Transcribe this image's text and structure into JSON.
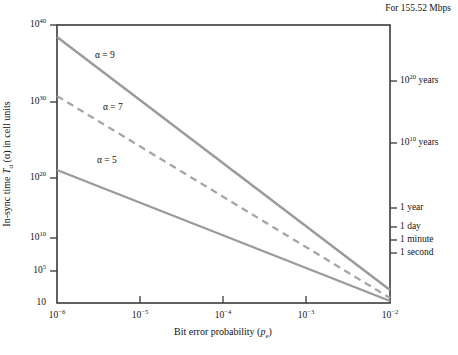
{
  "chart_data": {
    "type": "line",
    "title": "",
    "note": "For 155.52 Mbps",
    "xlabel_html": "Bit error probability (<i>p</i><sub>e</sub>)",
    "xlabel": "Bit error probability (pe)",
    "ylabel_html": "In-sync time <i>T</i><sub>d</sub> (α) in cell units",
    "ylabel": "In-sync time Td (α) in cell units",
    "xscale": "log",
    "yscale": "log",
    "xlim": [
      1e-06,
      0.01
    ],
    "ylim": [
      10,
      1e+40
    ],
    "grid": false,
    "legend_position": "inline-annotations",
    "xticks": [
      {
        "value": 1e-06,
        "mantissa": "10",
        "exponent": "−6"
      },
      {
        "value": 1e-05,
        "mantissa": "10",
        "exponent": "−5"
      },
      {
        "value": 0.0001,
        "mantissa": "10",
        "exponent": "−4"
      },
      {
        "value": 0.001,
        "mantissa": "10",
        "exponent": "−3"
      },
      {
        "value": 0.01,
        "mantissa": "10",
        "exponent": "−2"
      }
    ],
    "yticks_left": [
      {
        "value": 1e+40,
        "mantissa": "10",
        "exponent": "40"
      },
      {
        "value": 1e+30,
        "mantissa": "10",
        "exponent": "30"
      },
      {
        "value": 1e+20,
        "mantissa": "10",
        "exponent": "20"
      },
      {
        "value": 10000000000.0,
        "mantissa": "10",
        "exponent": "10"
      },
      {
        "value": 100000.0,
        "mantissa": "10",
        "exponent": "5"
      },
      {
        "value": 10,
        "mantissa": "10",
        "exponent": ""
      }
    ],
    "yticks_right": [
      {
        "label_mantissa": "10",
        "label_exponent": "20",
        "label_suffix": " years",
        "y_px": 81
      },
      {
        "label_mantissa": "10",
        "label_exponent": "10",
        "label_suffix": " years",
        "y_px": 143
      },
      {
        "label_mantissa": "1",
        "label_exponent": "",
        "label_suffix": " year",
        "y_px": 208
      },
      {
        "label_mantissa": "1",
        "label_exponent": "",
        "label_suffix": " day",
        "y_px": 227
      },
      {
        "label_mantissa": "1",
        "label_exponent": "",
        "label_suffix": " minute",
        "y_px": 240
      },
      {
        "label_mantissa": "1",
        "label_exponent": "",
        "label_suffix": " second",
        "y_px": 253
      }
    ],
    "series": [
      {
        "name": "α = 9",
        "style": "solid",
        "color": "#9a9a9a",
        "x": [
          1e-06,
          0.01
        ],
        "values": [
          2e+38,
          160.0
        ],
        "annotation": "α = 9",
        "annotation_x_px": 95,
        "annotation_y_px": 56
      },
      {
        "name": "α = 7",
        "style": "dashed",
        "color": "#a6a6a6",
        "x": [
          1e-06,
          0.01
        ],
        "values": [
          2.5e+31,
          30.0
        ],
        "annotation": "α = 7",
        "annotation_x_px": 103,
        "annotation_y_px": 108
      },
      {
        "name": "α = 5",
        "style": "solid",
        "color": "#9a9a9a",
        "x": [
          1e-06,
          0.01
        ],
        "values": [
          1.2e+22,
          13.0
        ],
        "annotation": "α = 5",
        "annotation_x_px": 97,
        "annotation_y_px": 161
      }
    ]
  },
  "axes": {
    "frame_color": "#3a3a3a",
    "line_color": "#9a9a9a"
  }
}
